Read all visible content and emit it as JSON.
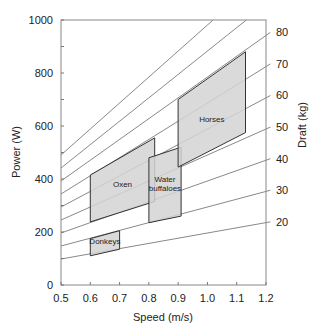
{
  "chart_data": {
    "type": "area",
    "title": "",
    "xlabel": "Speed (m/s)",
    "ylabel": "Power (W)",
    "y2label": "Draft (kg)",
    "xlim": [
      0.5,
      1.2
    ],
    "ylim": [
      0,
      1000
    ],
    "xticks": [
      0.5,
      0.6,
      0.7,
      0.8,
      0.9,
      1.0,
      1.1,
      1.2
    ],
    "xtick_labels": [
      "0.5",
      "0.6",
      "0.7",
      "0.8",
      "0.9",
      "1.0",
      "1.1",
      "1.2"
    ],
    "yticks": [
      0,
      200,
      400,
      600,
      800,
      1000
    ],
    "ytick_labels": [
      "0",
      "200",
      "400",
      "600",
      "800",
      "1000"
    ],
    "grid": false,
    "draft_lines": {
      "description": "Iso-draft lines: Power = Draft(kg) x 9.81 x Speed",
      "drafts_kg": [
        20,
        30,
        40,
        50,
        60,
        70,
        80,
        90,
        100
      ],
      "labels": [
        "20",
        "30",
        "40",
        "50",
        "60",
        "70",
        "80",
        "",
        ""
      ]
    },
    "series": [
      {
        "name": "Donkeys",
        "polygon": [
          [
            0.6,
            175
          ],
          [
            0.7,
            205
          ],
          [
            0.7,
            135
          ],
          [
            0.6,
            110
          ]
        ]
      },
      {
        "name": "Oxen",
        "polygon": [
          [
            0.6,
            415
          ],
          [
            0.82,
            555
          ],
          [
            0.82,
            315
          ],
          [
            0.6,
            238
          ]
        ]
      },
      {
        "name": "Water buffaloes",
        "polygon": [
          [
            0.8,
            480
          ],
          [
            0.91,
            520
          ],
          [
            0.91,
            260
          ],
          [
            0.8,
            235
          ]
        ]
      },
      {
        "name": "Horses",
        "polygon": [
          [
            0.9,
            700
          ],
          [
            1.13,
            880
          ],
          [
            1.13,
            575
          ],
          [
            0.9,
            445
          ]
        ]
      }
    ],
    "region_labels": [
      {
        "text": "Donkeys",
        "x": 0.65,
        "y": 165
      },
      {
        "text": "Oxen",
        "x": 0.71,
        "y": 380
      },
      {
        "text": "Water",
        "x": 0.855,
        "y": 400
      },
      {
        "text": "buffaloes",
        "x": 0.855,
        "y": 365
      },
      {
        "text": "Horses",
        "x": 1.015,
        "y": 625
      }
    ],
    "colors": {
      "fill": "#d4d4d4",
      "edge": "#333333",
      "line": "#555555",
      "axis": "#777777"
    }
  }
}
